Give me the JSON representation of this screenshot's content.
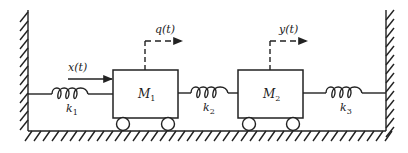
{
  "diagram": {
    "type": "two-mass spring system",
    "masses": [
      {
        "id": "M1",
        "label": "M",
        "subscript": "1",
        "box": {
          "x": 113,
          "y": 70,
          "w": 65,
          "h": 48
        }
      },
      {
        "id": "M2",
        "label": "M",
        "subscript": "2",
        "box": {
          "x": 238,
          "y": 70,
          "w": 65,
          "h": 48
        }
      }
    ],
    "springs": [
      {
        "id": "k1",
        "label": "k",
        "subscript": "1",
        "from": 28,
        "to": 113,
        "y": 94
      },
      {
        "id": "k2",
        "label": "k",
        "subscript": "2",
        "from": 178,
        "to": 238,
        "y": 93
      },
      {
        "id": "k3",
        "label": "k",
        "subscript": "3",
        "from": 303,
        "to": 386,
        "y": 93
      }
    ],
    "signals": [
      {
        "id": "x",
        "label": "x(t)",
        "kind": "input-force"
      },
      {
        "id": "q",
        "label": "q(t)",
        "kind": "displacement-M1"
      },
      {
        "id": "y",
        "label": "y(t)",
        "kind": "displacement-M2"
      }
    ],
    "colors": {
      "stroke": "#222222",
      "background": "#ffffff"
    }
  }
}
